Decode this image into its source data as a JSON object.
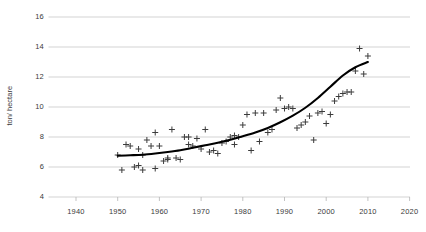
{
  "chart_data": {
    "type": "scatter",
    "title": "",
    "subtitle": "",
    "xlabel": "",
    "ylabel": "ton/ hectare",
    "xlim": [
      1935,
      2023
    ],
    "ylim": [
      4,
      16
    ],
    "xticks": [
      1940,
      1950,
      1960,
      1970,
      1980,
      1990,
      2000,
      2010,
      2020
    ],
    "yticks": [
      4,
      6,
      8,
      10,
      12,
      14,
      16
    ],
    "grid": "horizontal",
    "legend": "none",
    "marker": "plus",
    "marker_color": "#3c3c3c",
    "trend_color": "#000000",
    "series": [
      {
        "name": "yield observations",
        "type": "scatter",
        "points": [
          [
            1950,
            6.8
          ],
          [
            1951,
            5.8
          ],
          [
            1952,
            7.5
          ],
          [
            1953,
            7.4
          ],
          [
            1954,
            6.0
          ],
          [
            1955,
            6.1
          ],
          [
            1955,
            7.2
          ],
          [
            1956,
            5.8
          ],
          [
            1956,
            6.8
          ],
          [
            1957,
            7.8
          ],
          [
            1958,
            7.4
          ],
          [
            1959,
            5.9
          ],
          [
            1959,
            8.3
          ],
          [
            1960,
            7.4
          ],
          [
            1961,
            6.4
          ],
          [
            1962,
            6.5
          ],
          [
            1962,
            6.6
          ],
          [
            1963,
            8.5
          ],
          [
            1964,
            6.6
          ],
          [
            1965,
            6.5
          ],
          [
            1966,
            8.0
          ],
          [
            1967,
            8.0
          ],
          [
            1967,
            7.5
          ],
          [
            1968,
            7.4
          ],
          [
            1969,
            7.9
          ],
          [
            1970,
            7.2
          ],
          [
            1971,
            8.5
          ],
          [
            1972,
            7.0
          ],
          [
            1973,
            7.1
          ],
          [
            1974,
            6.9
          ],
          [
            1975,
            7.6
          ],
          [
            1976,
            7.7
          ],
          [
            1977,
            8.0
          ],
          [
            1978,
            8.1
          ],
          [
            1978,
            7.5
          ],
          [
            1979,
            8.0
          ],
          [
            1980,
            8.8
          ],
          [
            1981,
            9.5
          ],
          [
            1982,
            7.1
          ],
          [
            1983,
            9.6
          ],
          [
            1984,
            7.7
          ],
          [
            1985,
            9.6
          ],
          [
            1986,
            8.3
          ],
          [
            1987,
            8.5
          ],
          [
            1988,
            9.8
          ],
          [
            1989,
            10.6
          ],
          [
            1990,
            9.9
          ],
          [
            1991,
            10.0
          ],
          [
            1992,
            9.9
          ],
          [
            1993,
            8.6
          ],
          [
            1994,
            8.8
          ],
          [
            1995,
            9.0
          ],
          [
            1996,
            9.4
          ],
          [
            1997,
            7.8
          ],
          [
            1998,
            9.6
          ],
          [
            1999,
            9.7
          ],
          [
            2000,
            8.9
          ],
          [
            2001,
            9.5
          ],
          [
            2002,
            10.4
          ],
          [
            2003,
            10.7
          ],
          [
            2004,
            10.9
          ],
          [
            2005,
            11.0
          ],
          [
            2006,
            11.0
          ],
          [
            2007,
            12.4
          ],
          [
            2008,
            13.9
          ],
          [
            2009,
            12.2
          ],
          [
            2010,
            13.4
          ]
        ]
      },
      {
        "name": "trend",
        "type": "line",
        "points": [
          [
            1950,
            6.75
          ],
          [
            1953,
            6.78
          ],
          [
            1956,
            6.82
          ],
          [
            1959,
            6.9
          ],
          [
            1962,
            7.0
          ],
          [
            1965,
            7.12
          ],
          [
            1968,
            7.28
          ],
          [
            1971,
            7.45
          ],
          [
            1974,
            7.62
          ],
          [
            1977,
            7.82
          ],
          [
            1980,
            8.05
          ],
          [
            1983,
            8.3
          ],
          [
            1986,
            8.6
          ],
          [
            1989,
            8.98
          ],
          [
            1992,
            9.42
          ],
          [
            1995,
            9.95
          ],
          [
            1998,
            10.6
          ],
          [
            2001,
            11.35
          ],
          [
            2004,
            12.1
          ],
          [
            2007,
            12.65
          ],
          [
            2010,
            13.0
          ]
        ]
      }
    ]
  }
}
